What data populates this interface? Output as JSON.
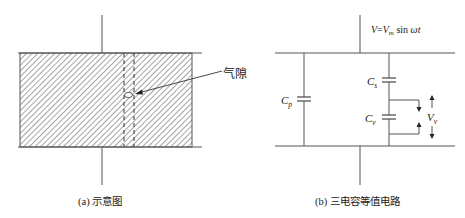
{
  "figure_a": {
    "caption": "(a) 示意图",
    "void_label": "气隙"
  },
  "figure_b": {
    "caption": "(b) 三电容等值电路",
    "source_voltage": {
      "lhs": "V",
      "eq": "=",
      "v": "V",
      "sub": "m",
      "rest": " sin ",
      "omega_t": "ωt"
    },
    "capacitors": {
      "cp": {
        "base": "C",
        "sub": "p"
      },
      "cs": {
        "base": "C",
        "sub": "s"
      },
      "cv": {
        "base": "C",
        "sub": "v"
      }
    },
    "voltage_label": {
      "base": "V",
      "sub": "v"
    }
  },
  "colors": {
    "line": "#555555",
    "hatch": "#555555",
    "text": "#222222"
  }
}
